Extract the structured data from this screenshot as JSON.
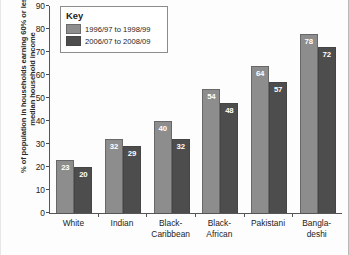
{
  "chart_data": {
    "type": "bar",
    "title": "",
    "xlabel": "",
    "ylabel": "% of population in households earning 60% or less of median household income",
    "ylim": [
      0,
      90
    ],
    "ytick_labels": [
      "90",
      "80",
      "70",
      "60",
      "50",
      "40",
      "30",
      "20",
      "10",
      "0"
    ],
    "ytick_values": [
      90,
      80,
      70,
      60,
      50,
      40,
      30,
      20,
      10,
      0
    ],
    "grid": false,
    "legend_position": "top-left",
    "legend_title": "Key",
    "categories": [
      "White",
      "Indian",
      "Black-Caribbean",
      "Black-African",
      "Pakistani",
      "Bangladeshi"
    ],
    "category_lines": [
      [
        "White"
      ],
      [
        "Indian"
      ],
      [
        "Black-",
        "Caribbean"
      ],
      [
        "Black-",
        "African"
      ],
      [
        "Pakistani"
      ],
      [
        "Bangla-",
        "deshi"
      ]
    ],
    "series": [
      {
        "name": "1996/97 to 1998/99",
        "color": "#8d8d8d",
        "values": [
          23,
          32,
          40,
          54,
          64,
          78
        ]
      },
      {
        "name": "2006/07 to 2008/09",
        "color": "#4d4d4d",
        "values": [
          20,
          29,
          32,
          48,
          57,
          72
        ]
      }
    ]
  }
}
